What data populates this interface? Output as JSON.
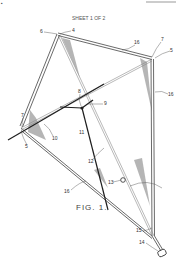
{
  "header": {
    "sheet": "SHEET 1 OF 2",
    "corner_mark": "▪"
  },
  "figure": {
    "caption": "FIG. 1."
  },
  "labels": [
    {
      "id": "l6-top",
      "text": "6",
      "x": 40,
      "y": 33
    },
    {
      "id": "l4-top",
      "text": "4",
      "x": 72,
      "y": 32
    },
    {
      "id": "l16-top",
      "text": "16",
      "x": 136,
      "y": 44
    },
    {
      "id": "l7-right",
      "text": "7",
      "x": 162,
      "y": 41
    },
    {
      "id": "l5-right",
      "text": "5",
      "x": 171,
      "y": 52
    },
    {
      "id": "l16-right",
      "text": "16",
      "x": 169,
      "y": 95
    },
    {
      "id": "l8",
      "text": "8",
      "x": 78,
      "y": 93
    },
    {
      "id": "l9",
      "text": "9",
      "x": 104,
      "y": 104
    },
    {
      "id": "l7-left",
      "text": "7",
      "x": 21,
      "y": 117
    },
    {
      "id": "l10",
      "text": "10",
      "x": 53,
      "y": 139
    },
    {
      "id": "l5-left",
      "text": "5",
      "x": 25,
      "y": 146
    },
    {
      "id": "l11",
      "text": "11",
      "x": 80,
      "y": 134
    },
    {
      "id": "l12",
      "text": "12",
      "x": 90,
      "y": 162
    },
    {
      "id": "l13",
      "text": "13",
      "x": 110,
      "y": 183
    },
    {
      "id": "l16-left",
      "text": "16",
      "x": 66,
      "y": 192
    },
    {
      "id": "l15",
      "text": "15",
      "x": 138,
      "y": 232
    },
    {
      "id": "l14",
      "text": "14",
      "x": 141,
      "y": 244
    }
  ],
  "colors": {
    "line": "#2a2a2a",
    "shade": "#6a6a6a",
    "faint": "#9a9a9a",
    "background": "#ffffff"
  }
}
